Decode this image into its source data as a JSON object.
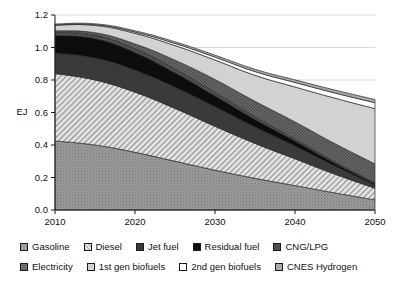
{
  "chart_data": {
    "type": "area",
    "stacked": true,
    "title": "",
    "xlabel": "",
    "ylabel": "EJ",
    "x": [
      2010,
      2015,
      2020,
      2025,
      2030,
      2035,
      2040,
      2045,
      2050
    ],
    "xticks": [
      "2010",
      "2020",
      "2030",
      "2040",
      "2050"
    ],
    "xtick_values": [
      2010,
      2020,
      2030,
      2040,
      2050
    ],
    "xlim": [
      2010,
      2050
    ],
    "yticks": [
      "0.0",
      "0.2",
      "0.4",
      "0.6",
      "0.8",
      "1.0",
      "1.2"
    ],
    "ytick_values": [
      0.0,
      0.2,
      0.4,
      0.6,
      0.8,
      1.0,
      1.2
    ],
    "ylim": [
      0.0,
      1.2
    ],
    "grid": true,
    "legend_position": "bottom",
    "series": [
      {
        "name": "Gasoline",
        "pattern": "dots-gray",
        "color": "#9a9a9a",
        "values": [
          0.425,
          0.4,
          0.355,
          0.3,
          0.245,
          0.195,
          0.15,
          0.105,
          0.062
        ]
      },
      {
        "name": "Diesel",
        "pattern": "diagonal-hatch-light",
        "color": "#dedede",
        "values": [
          0.415,
          0.4,
          0.37,
          0.325,
          0.27,
          0.215,
          0.165,
          0.115,
          0.072
        ]
      },
      {
        "name": "Jet fuel",
        "pattern": "solid-dark-gray",
        "color": "#3a3a3a",
        "values": [
          0.125,
          0.135,
          0.135,
          0.13,
          0.12,
          0.1,
          0.078,
          0.05,
          0.02
        ]
      },
      {
        "name": "Residual fuel",
        "pattern": "solid-black",
        "color": "#0d0d0d",
        "values": [
          0.11,
          0.12,
          0.11,
          0.09,
          0.068,
          0.048,
          0.032,
          0.018,
          0.008
        ]
      },
      {
        "name": "CNG/LPG",
        "pattern": "solid-mid-dark",
        "color": "#4f4f4f",
        "values": [
          0.018,
          0.02,
          0.022,
          0.022,
          0.02,
          0.016,
          0.012,
          0.008,
          0.004
        ]
      },
      {
        "name": "Electricity",
        "pattern": "checker-dark",
        "color": "#6e6e6e",
        "values": [
          0.01,
          0.016,
          0.03,
          0.055,
          0.08,
          0.095,
          0.105,
          0.112,
          0.118
        ]
      },
      {
        "name": "1st gen biofuels",
        "pattern": "light-gray",
        "color": "#cfcfcf",
        "values": [
          0.035,
          0.045,
          0.065,
          0.09,
          0.12,
          0.16,
          0.215,
          0.28,
          0.34
        ]
      },
      {
        "name": "2nd gen biofuels",
        "pattern": "white",
        "color": "#ffffff",
        "values": [
          0.002,
          0.004,
          0.008,
          0.013,
          0.018,
          0.023,
          0.028,
          0.032,
          0.036
        ]
      },
      {
        "name": "CNES Hydrogen",
        "pattern": "mid-gray",
        "color": "#a6a6a6",
        "values": [
          0.005,
          0.006,
          0.008,
          0.01,
          0.012,
          0.014,
          0.016,
          0.018,
          0.02
        ]
      }
    ],
    "totals": [
      1.145,
      1.146,
      1.103,
      1.035,
      0.953,
      0.866,
      0.801,
      0.738,
      0.68
    ]
  },
  "legend": {
    "rows": [
      [
        {
          "label": "Gasoline",
          "swatch": "gasoline-swatch"
        },
        {
          "label": "Diesel",
          "swatch": "diesel-swatch"
        },
        {
          "label": "Jet fuel",
          "swatch": "jet-fuel-swatch"
        },
        {
          "label": "Residual fuel",
          "swatch": "residual-fuel-swatch"
        },
        {
          "label": "CNG/LPG",
          "swatch": "cng-lpg-swatch"
        }
      ],
      [
        {
          "label": "Electricity",
          "swatch": "electricity-swatch"
        },
        {
          "label": "1st gen biofuels",
          "swatch": "first-gen-biofuels-swatch"
        },
        {
          "label": "2nd gen biofuels",
          "swatch": "second-gen-biofuels-swatch"
        },
        {
          "label": "CNES Hydrogen",
          "swatch": "cnes-hydrogen-swatch"
        }
      ]
    ]
  },
  "axis": {
    "y_label": "EJ"
  }
}
